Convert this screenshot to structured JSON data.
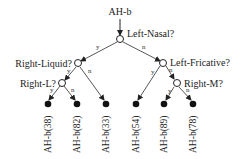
{
  "root_label": "AH-b",
  "nodes": {
    "n0": "Left-Nasal?",
    "n1": "Right-Liquid?",
    "n2": "Left-Fricative?",
    "n3": "Right-L?",
    "n4": "Right-M?"
  },
  "edge_labels": {
    "yes": "y",
    "no": "n"
  },
  "leaves": [
    "AH-b(38)",
    "AH-b(82)",
    "AH-b(33)",
    "AH-b(54)",
    "AH-b(89)",
    "AH-b(78)"
  ]
}
